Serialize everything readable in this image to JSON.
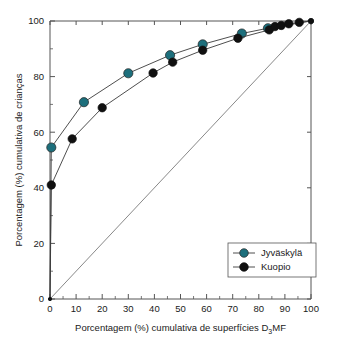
{
  "chart_data": {
    "type": "line",
    "title": "",
    "xlabel": "Porcentagem (%) cumulativa de superfícies D3MF",
    "xlabel_pre": "Porcentagem (%) cumulativa de superfícies D",
    "xlabel_sub": "3",
    "xlabel_post": "MF",
    "ylabel": "Porcentagem (%) cumulativa de crianças",
    "xlim": [
      0,
      100
    ],
    "ylim": [
      0,
      100
    ],
    "xticks": [
      0,
      10,
      20,
      30,
      40,
      50,
      60,
      70,
      80,
      90,
      100
    ],
    "yticks": [
      0,
      20,
      40,
      60,
      80,
      100
    ],
    "yticks_minor": [
      10,
      30,
      50,
      70,
      90
    ],
    "grid": false,
    "legend_position": "lower-right",
    "reference_line": {
      "name": "line-of-equality",
      "from": [
        0,
        0
      ],
      "to": [
        100,
        100
      ]
    },
    "series": [
      {
        "name": "Jyväskylä",
        "color": "#1d6f7c",
        "points": [
          [
            0,
            0
          ],
          [
            0.5,
            54.5
          ],
          [
            13,
            70.8
          ],
          [
            30,
            81.2
          ],
          [
            46,
            87.7
          ],
          [
            58.5,
            91.6
          ],
          [
            73.5,
            95.5
          ],
          [
            83.5,
            97.4
          ],
          [
            100,
            100
          ]
        ]
      },
      {
        "name": "Kuopio",
        "color": "#101010",
        "points": [
          [
            0,
            0
          ],
          [
            0.5,
            41.0
          ],
          [
            8.5,
            57.6
          ],
          [
            20,
            68.8
          ],
          [
            39.5,
            81.3
          ],
          [
            47,
            85.2
          ],
          [
            58.5,
            89.5
          ],
          [
            72,
            93.8
          ],
          [
            84,
            96.8
          ],
          [
            86.2,
            98.0
          ],
          [
            88.6,
            98.4
          ],
          [
            91.5,
            99.0
          ],
          [
            95.5,
            99.5
          ],
          [
            100,
            100
          ]
        ]
      }
    ]
  },
  "legend": {
    "items": [
      {
        "label": "Jyväskylä",
        "color": "#1d6f7c"
      },
      {
        "label": "Kuopio",
        "color": "#101010"
      }
    ]
  },
  "axes": {
    "x_tick_labels": [
      "0",
      "10",
      "20",
      "30",
      "40",
      "50",
      "60",
      "70",
      "80",
      "90",
      "100"
    ],
    "y_tick_labels": [
      "0",
      "20",
      "40",
      "60",
      "80",
      "100"
    ]
  }
}
